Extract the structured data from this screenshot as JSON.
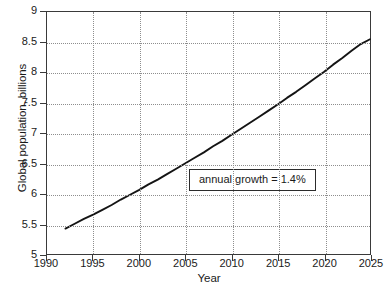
{
  "chart_data": {
    "type": "line",
    "title": "",
    "xlabel": "Year",
    "ylabel": "Global population, billions",
    "xlim": [
      1990,
      2025
    ],
    "ylim": [
      5,
      9
    ],
    "grid": true,
    "legend": null,
    "xticks": [
      "1990",
      "1995",
      "2000",
      "2005",
      "2010",
      "2015",
      "2020",
      "2025"
    ],
    "xtick_values": [
      1990,
      1995,
      2000,
      2005,
      2010,
      2015,
      2020,
      2025
    ],
    "yticks": [
      "5",
      "5.5",
      "6",
      "6.5",
      "7",
      "7.5",
      "8",
      "8.5",
      "9"
    ],
    "ytick_values": [
      5,
      5.5,
      6,
      6.5,
      7,
      7.5,
      8,
      8.5,
      9
    ],
    "series": [
      {
        "name": "Global population",
        "x": [
          1992,
          1993,
          1994,
          1995,
          1996,
          1997,
          1998,
          1999,
          2000,
          2001,
          2002,
          2003,
          2004,
          2005,
          2006,
          2007,
          2008,
          2009,
          2010,
          2011,
          2012,
          2013,
          2014,
          2015,
          2016,
          2017,
          2018,
          2019,
          2020,
          2021,
          2022,
          2023,
          2024,
          2025
        ],
        "values": [
          5.42,
          5.5,
          5.58,
          5.65,
          5.73,
          5.81,
          5.9,
          5.98,
          6.06,
          6.15,
          6.23,
          6.32,
          6.41,
          6.5,
          6.59,
          6.68,
          6.78,
          6.87,
          6.97,
          7.07,
          7.17,
          7.27,
          7.37,
          7.47,
          7.58,
          7.68,
          7.79,
          7.9,
          8.01,
          8.13,
          8.24,
          8.36,
          8.47,
          8.55
        ]
      }
    ],
    "annotations": [
      {
        "text": "annual growth = 1.4%",
        "x": 2006,
        "y": 6.25
      }
    ]
  },
  "annotation": {
    "growth_label": "annual growth = 1.4%"
  },
  "axes": {
    "x_title": "Year",
    "y_title": "Global population, billions"
  }
}
